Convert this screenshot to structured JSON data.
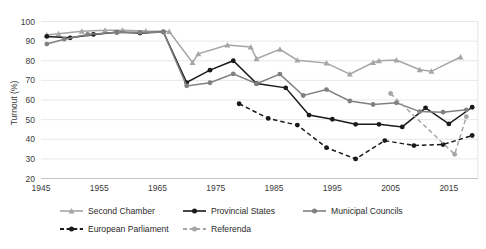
{
  "chart_data": {
    "type": "line",
    "title": "",
    "xlabel": "",
    "ylabel": "Turnout (%)",
    "xlim": [
      1945,
      2020
    ],
    "ylim": [
      20,
      100
    ],
    "ytick_step": 10,
    "yticks": [
      20,
      30,
      40,
      50,
      60,
      70,
      80,
      90,
      100
    ],
    "xticks": [
      1945,
      1955,
      1965,
      1975,
      1985,
      1995,
      2005,
      2015
    ],
    "grid": "horizontal",
    "legend_position": "bottom",
    "colors": {
      "second_chamber": "#a6a6a6",
      "provincial_states": "#1a1a1a",
      "municipal_councils": "#808080",
      "european_parliament": "#1a1a1a",
      "referenda": "#a6a6a6"
    },
    "series": [
      {
        "name": "Second Chamber",
        "marker": "triangle",
        "dash": "solid",
        "color": "#a6a6a6",
        "points": [
          [
            1946,
            93.1
          ],
          [
            1948,
            93.7
          ],
          [
            1952,
            95.0
          ],
          [
            1956,
            95.5
          ],
          [
            1959,
            95.6
          ],
          [
            1963,
            95.1
          ],
          [
            1967,
            94.9
          ],
          [
            1971,
            79.1
          ],
          [
            1972,
            83.5
          ],
          [
            1977,
            88.0
          ],
          [
            1981,
            87.0
          ],
          [
            1982,
            81.0
          ],
          [
            1986,
            85.8
          ],
          [
            1989,
            80.3
          ],
          [
            1994,
            78.8
          ],
          [
            1998,
            73.2
          ],
          [
            2002,
            79.1
          ],
          [
            2003,
            80.0
          ],
          [
            2006,
            80.4
          ],
          [
            2010,
            75.4
          ],
          [
            2012,
            74.6
          ],
          [
            2017,
            81.9
          ]
        ]
      },
      {
        "name": "Provincial States",
        "marker": "circle",
        "dash": "solid",
        "color": "#1a1a1a",
        "points": [
          [
            1946,
            92.4
          ],
          [
            1950,
            91.7
          ],
          [
            1954,
            93.4
          ],
          [
            1958,
            94.5
          ],
          [
            1962,
            94.1
          ],
          [
            1966,
            94.7
          ],
          [
            1970,
            68.9
          ],
          [
            1974,
            75.2
          ],
          [
            1978,
            80.0
          ],
          [
            1982,
            68.4
          ],
          [
            1987,
            66.2
          ],
          [
            1991,
            52.3
          ],
          [
            1995,
            50.2
          ],
          [
            1999,
            47.6
          ],
          [
            2003,
            47.6
          ],
          [
            2007,
            46.3
          ],
          [
            2011,
            56.0
          ],
          [
            2015,
            47.8
          ],
          [
            2019,
            56.3
          ]
        ]
      },
      {
        "name": "Municipal Councils",
        "marker": "circle",
        "dash": "solid",
        "color": "#808080",
        "points": [
          [
            1946,
            88.5
          ],
          [
            1949,
            91.0
          ],
          [
            1953,
            93.4
          ],
          [
            1958,
            94.5
          ],
          [
            1962,
            94.5
          ],
          [
            1966,
            94.7
          ],
          [
            1970,
            67.2
          ],
          [
            1974,
            68.8
          ],
          [
            1978,
            73.3
          ],
          [
            1982,
            68.3
          ],
          [
            1986,
            73.2
          ],
          [
            1990,
            62.3
          ],
          [
            1994,
            65.3
          ],
          [
            1998,
            59.5
          ],
          [
            2002,
            57.7
          ],
          [
            2006,
            58.6
          ],
          [
            2010,
            54.1
          ],
          [
            2014,
            53.8
          ],
          [
            2018,
            55.0
          ]
        ]
      },
      {
        "name": "European Parliament",
        "marker": "circle",
        "dash": "dashed",
        "color": "#1a1a1a",
        "points": [
          [
            1979,
            58.1
          ],
          [
            1984,
            50.6
          ],
          [
            1989,
            47.2
          ],
          [
            1994,
            35.7
          ],
          [
            1999,
            30.0
          ],
          [
            2004,
            39.3
          ],
          [
            2009,
            36.8
          ],
          [
            2014,
            37.3
          ],
          [
            2019,
            41.9
          ]
        ]
      },
      {
        "name": "Referenda",
        "marker": "circle",
        "dash": "dashed",
        "color": "#a6a6a6",
        "points": [
          [
            2005,
            63.3
          ],
          [
            2016,
            32.3
          ],
          [
            2018,
            51.5
          ]
        ]
      }
    ]
  },
  "legend": {
    "entries": [
      {
        "label": "Second Chamber",
        "color": "#a6a6a6",
        "marker": "triangle",
        "dash": "solid"
      },
      {
        "label": "Provincial States",
        "color": "#1a1a1a",
        "marker": "circle",
        "dash": "solid"
      },
      {
        "label": "Municipal Councils",
        "color": "#808080",
        "marker": "circle",
        "dash": "solid"
      },
      {
        "label": "European Parliament",
        "color": "#1a1a1a",
        "marker": "circle",
        "dash": "dashed"
      },
      {
        "label": "Referenda",
        "color": "#a6a6a6",
        "marker": "circle",
        "dash": "dashed"
      }
    ]
  }
}
